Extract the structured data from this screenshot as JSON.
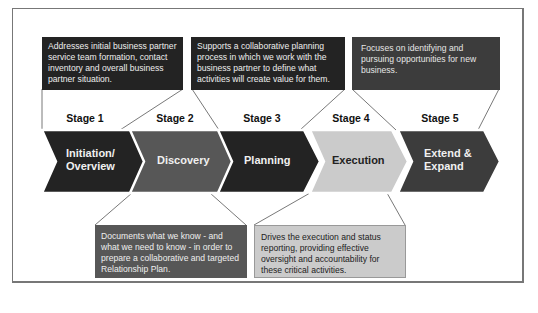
{
  "colors": {
    "dark": "#232323",
    "mid": "#575757",
    "light": "#cbcbcb",
    "darkgray": "#3c3c3c",
    "line": "#555555",
    "frame": "#777777"
  },
  "stages": [
    {
      "stage": "Stage 1",
      "name": "Initiation/ Overview",
      "name_lines": [
        "Initiation/",
        "Overview"
      ],
      "shade": "dark"
    },
    {
      "stage": "Stage 2",
      "name": "Discovery",
      "name_lines": [
        "Discovery"
      ],
      "shade": "mid"
    },
    {
      "stage": "Stage 3",
      "name": "Planning",
      "name_lines": [
        "Planning"
      ],
      "shade": "dark"
    },
    {
      "stage": "Stage 4",
      "name": "Execution",
      "name_lines": [
        "Execution"
      ],
      "shade": "light"
    },
    {
      "stage": "Stage 5",
      "name": "Extend & Expand",
      "name_lines": [
        "Extend &",
        "Expand"
      ],
      "shade": "darkgray"
    }
  ],
  "callouts": {
    "top": [
      {
        "stage_ref": "Stage 1",
        "text": "Addresses initial business partner service team formation, contact inventory and overall business partner situation."
      },
      {
        "stage_ref": "Stage 3",
        "text": "Supports a collaborative planning process in which we work with the business partner to define what activities will create value for them."
      },
      {
        "stage_ref": "Stage 5",
        "text": "Focuses on identifying and pursuing opportunities for new business."
      }
    ],
    "bottom": [
      {
        "stage_ref": "Stage 2",
        "text": "Documents what we know - and what we need to know - in order to prepare a collaborative and targeted Relationship Plan."
      },
      {
        "stage_ref": "Stage 4",
        "text": "Drives the execution and status reporting, providing effective oversight and accountability for these critical activities."
      }
    ]
  }
}
